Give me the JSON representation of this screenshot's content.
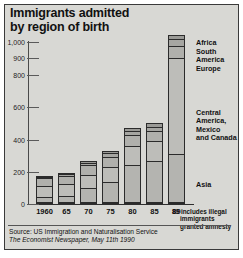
{
  "title": {
    "line1": "Immigrants admitted",
    "line2": "by region of birth"
  },
  "source": {
    "line1": "Source: US Immigration and Naturalisation Service",
    "line2": "The Economist Newspaper, May 11th 1990"
  },
  "note": {
    "line1": "89 includes illegal",
    "line2": "immigrants",
    "line3": "granted amnesty"
  },
  "legend": {
    "items": [
      {
        "label": "Africa"
      },
      {
        "label": "South America"
      },
      {
        "label": "Europe"
      },
      {
        "label": "Central America, Mexico and Canada"
      },
      {
        "label": "Asia"
      }
    ]
  },
  "chart_data": {
    "type": "bar",
    "subtype": "stacked-vertical",
    "title": "Immigrants admitted by region of birth",
    "xlabel": "",
    "ylabel": "",
    "ylim": [
      0,
      1000
    ],
    "yticks": [
      0,
      200,
      400,
      600,
      800,
      900,
      1000
    ],
    "ytick_labels": [
      "0",
      "200",
      "400",
      "600",
      "800",
      "900",
      "1,000"
    ],
    "grid": false,
    "units": "thousands of immigrants",
    "legend_position": "right",
    "categories": [
      "1960",
      "65",
      "70",
      "75",
      "80",
      "85",
      "89"
    ],
    "series": [
      {
        "name": "Asia",
        "values": [
          35,
          40,
          90,
          130,
          230,
          255,
          300
        ]
      },
      {
        "name": "Central America, Mexico and Canada",
        "values": [
          75,
          80,
          85,
          95,
          125,
          130,
          595
        ]
      },
      {
        "name": "Europe",
        "values": [
          48,
          52,
          60,
          65,
          65,
          62,
          75
        ]
      },
      {
        "name": "South America",
        "values": [
          10,
          13,
          18,
          22,
          28,
          28,
          40
        ]
      },
      {
        "name": "Africa",
        "values": [
          5,
          7,
          10,
          13,
          17,
          20,
          25
        ]
      }
    ],
    "totals": [
      173,
      192,
      263,
      325,
      465,
      495,
      1035
    ],
    "annotations": [
      "89 includes illegal immigrants granted amnesty"
    ]
  }
}
